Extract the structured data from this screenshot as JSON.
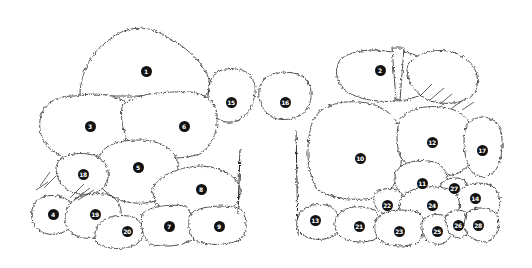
{
  "diagram": {
    "type": "garden-planting-plan",
    "style": "black line drawing on white",
    "colors": {
      "background": "#ffffff",
      "line": "#222222",
      "marker_fill": "#111111",
      "marker_text": "#ffffff"
    },
    "plants": [
      {
        "id": 1,
        "label": "1",
        "x": 146,
        "y": 71
      },
      {
        "id": 2,
        "label": "2",
        "x": 380,
        "y": 70
      },
      {
        "id": 3,
        "label": "3",
        "x": 90,
        "y": 126
      },
      {
        "id": 4,
        "label": "4",
        "x": 53,
        "y": 214
      },
      {
        "id": 5,
        "label": "5",
        "x": 138,
        "y": 167
      },
      {
        "id": 6,
        "label": "6",
        "x": 184,
        "y": 126
      },
      {
        "id": 7,
        "label": "7",
        "x": 169,
        "y": 226
      },
      {
        "id": 8,
        "label": "8",
        "x": 201,
        "y": 189
      },
      {
        "id": 9,
        "label": "9",
        "x": 219,
        "y": 226
      },
      {
        "id": 10,
        "label": "10",
        "x": 360,
        "y": 158
      },
      {
        "id": 11,
        "label": "11",
        "x": 422,
        "y": 183
      },
      {
        "id": 12,
        "label": "12",
        "x": 432,
        "y": 142
      },
      {
        "id": 13,
        "label": "13",
        "x": 315,
        "y": 220
      },
      {
        "id": 14,
        "label": "14",
        "x": 475,
        "y": 198
      },
      {
        "id": 15,
        "label": "15",
        "x": 231,
        "y": 102
      },
      {
        "id": 16,
        "label": "16",
        "x": 285,
        "y": 102
      },
      {
        "id": 17,
        "label": "17",
        "x": 482,
        "y": 150
      },
      {
        "id": 18,
        "label": "18",
        "x": 83,
        "y": 174
      },
      {
        "id": 19,
        "label": "19",
        "x": 95,
        "y": 214
      },
      {
        "id": 20,
        "label": "20",
        "x": 127,
        "y": 231
      },
      {
        "id": 21,
        "label": "21",
        "x": 359,
        "y": 226
      },
      {
        "id": 22,
        "label": "22",
        "x": 387,
        "y": 205
      },
      {
        "id": 23,
        "label": "23",
        "x": 399,
        "y": 231
      },
      {
        "id": 24,
        "label": "24",
        "x": 432,
        "y": 205
      },
      {
        "id": 25,
        "label": "25",
        "x": 437,
        "y": 231
      },
      {
        "id": 26,
        "label": "26",
        "x": 458,
        "y": 225
      },
      {
        "id": 27,
        "label": "27",
        "x": 454,
        "y": 188
      },
      {
        "id": 28,
        "label": "28",
        "x": 478,
        "y": 225
      }
    ]
  }
}
